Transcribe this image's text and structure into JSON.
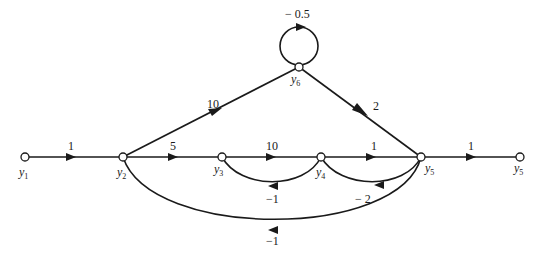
{
  "diagram": {
    "type": "signal-flow-graph",
    "nodes": [
      {
        "id": "y1",
        "label": "y",
        "sub": "1"
      },
      {
        "id": "y2",
        "label": "y",
        "sub": "2"
      },
      {
        "id": "y3",
        "label": "y",
        "sub": "3"
      },
      {
        "id": "y4",
        "label": "y",
        "sub": "4"
      },
      {
        "id": "y5",
        "label": "y",
        "sub": "5"
      },
      {
        "id": "y6",
        "label": "y",
        "sub": "6"
      },
      {
        "id": "y5out",
        "label": "y",
        "sub": "5"
      }
    ],
    "edges": [
      {
        "from": "y1",
        "to": "y2",
        "gain": "1"
      },
      {
        "from": "y2",
        "to": "y3",
        "gain": "5"
      },
      {
        "from": "y3",
        "to": "y4",
        "gain": "10"
      },
      {
        "from": "y4",
        "to": "y5",
        "gain": "1"
      },
      {
        "from": "y5",
        "to": "y5out",
        "gain": "1"
      },
      {
        "from": "y2",
        "to": "y6",
        "gain": "10"
      },
      {
        "from": "y6",
        "to": "y5",
        "gain": "2"
      },
      {
        "from": "y6",
        "to": "y6",
        "gain": "− 0.5"
      },
      {
        "from": "y4",
        "to": "y3",
        "gain": "−1"
      },
      {
        "from": "y5",
        "to": "y4",
        "gain": "− 2"
      },
      {
        "from": "y5",
        "to": "y2",
        "gain": "−1"
      }
    ]
  }
}
